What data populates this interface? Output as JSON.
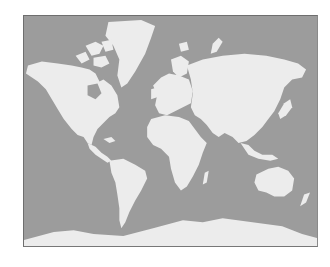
{
  "map": {
    "type": "world-map",
    "projection": "mercator",
    "colors": {
      "ocean": "#9c9c9c",
      "land": "#ececec",
      "border": "#6e6e6e",
      "background": "#ffffff"
    },
    "regions": [
      "North America",
      "Greenland",
      "Canadian Arctic Archipelago",
      "Central America",
      "South America",
      "Europe",
      "Africa",
      "Madagascar",
      "Asia",
      "Japan",
      "Southeast Asia",
      "Indonesia",
      "Australia",
      "New Zealand",
      "Antarctica"
    ]
  }
}
